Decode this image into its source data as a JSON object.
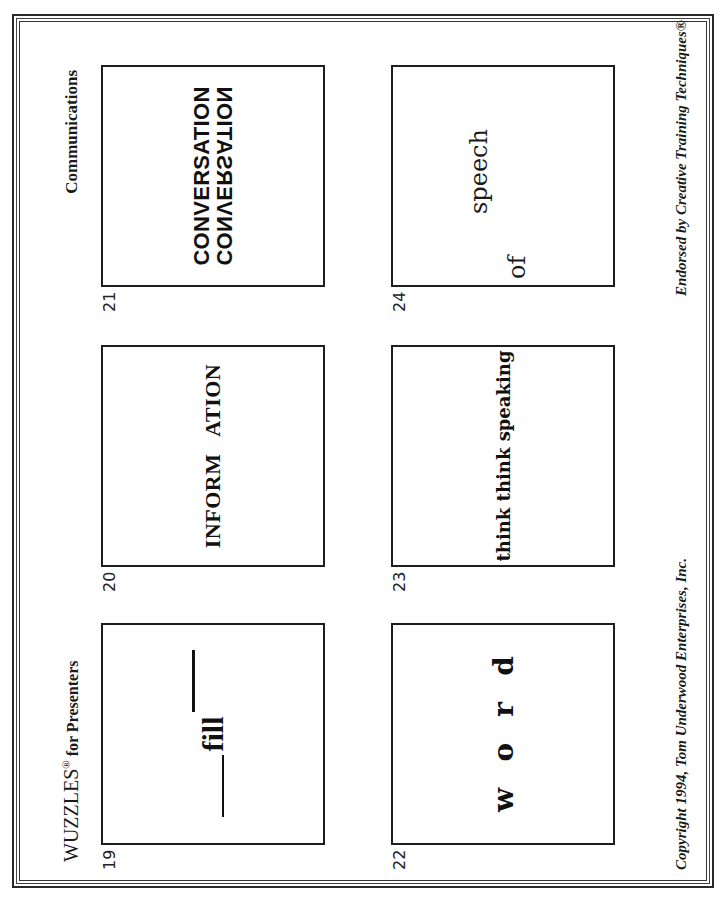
{
  "document": {
    "orientation": "rotated 90deg counter-clockwise",
    "header": {
      "title_main": "WUZZLES",
      "title_reg": "®",
      "title_rest": " for Presenters",
      "section": "Communications"
    },
    "footer": {
      "copyright": "Copyright 1994, Tom Underwood Enterprises, Inc.",
      "endorsed": "Endorsed by Creative Training Techniques®"
    },
    "puzzles": [
      {
        "number": "19",
        "text": "fill",
        "layout": "word 'fill' with a line before (low) and after (high)"
      },
      {
        "number": "20",
        "text": "INFORM   ATION"
      },
      {
        "number": "21",
        "line1": "CONVERSATION",
        "line2": "CONVERSATION",
        "line2_style": "mirrored upside-down"
      },
      {
        "number": "22",
        "letters": [
          "w",
          "o",
          "r",
          "d"
        ]
      },
      {
        "number": "23",
        "text": "think think speaking"
      },
      {
        "number": "24",
        "word1": "of",
        "word2": "speech"
      }
    ]
  }
}
